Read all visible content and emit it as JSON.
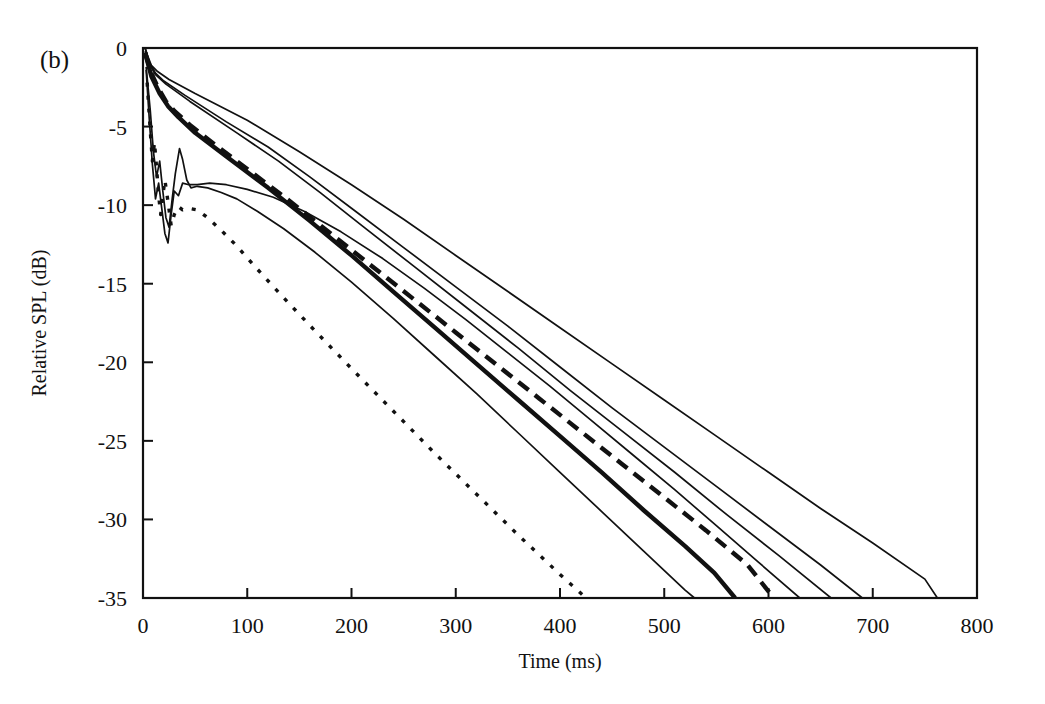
{
  "figure": {
    "panel_label": "(b)",
    "background_color": "#ffffff",
    "line_color": "#111111"
  },
  "chart_data": {
    "type": "line",
    "title": "",
    "subtitle": "",
    "xlabel": "Time (ms)",
    "ylabel": "Relative SPL (dB)",
    "xlim": [
      0,
      800
    ],
    "ylim": [
      -35,
      0
    ],
    "xticks": [
      0,
      100,
      200,
      300,
      400,
      500,
      600,
      700,
      800
    ],
    "xticklabels": [
      "0",
      "100",
      "200",
      "300",
      "400",
      "500",
      "600",
      "700",
      "800"
    ],
    "yticks": [
      0,
      -5,
      -10,
      -15,
      -20,
      -25,
      -30,
      -35
    ],
    "yticklabels": [
      "0",
      "-5",
      "-10",
      "-15",
      "-20",
      "-25",
      "-30",
      "-35"
    ],
    "grid": false,
    "legend": "none",
    "annotations": [
      "(b)"
    ],
    "series": [
      {
        "name": "decay-thin-1-longest",
        "style": "solid",
        "width": 1.7,
        "points": [
          [
            2,
            0.0
          ],
          [
            5,
            -0.6
          ],
          [
            8,
            -1.1
          ],
          [
            14,
            -1.5
          ],
          [
            25,
            -2.0
          ],
          [
            50,
            -2.9
          ],
          [
            100,
            -4.6
          ],
          [
            150,
            -6.6
          ],
          [
            200,
            -8.7
          ],
          [
            250,
            -10.9
          ],
          [
            300,
            -13.2
          ],
          [
            350,
            -15.5
          ],
          [
            400,
            -17.8
          ],
          [
            450,
            -20.1
          ],
          [
            500,
            -22.4
          ],
          [
            550,
            -24.7
          ],
          [
            600,
            -27.0
          ],
          [
            650,
            -29.3
          ],
          [
            700,
            -31.5
          ],
          [
            750,
            -33.8
          ],
          [
            762,
            -35.0
          ]
        ]
      },
      {
        "name": "decay-thin-2",
        "style": "solid",
        "width": 1.7,
        "points": [
          [
            2,
            0.0
          ],
          [
            6,
            -0.9
          ],
          [
            12,
            -1.6
          ],
          [
            20,
            -2.1
          ],
          [
            40,
            -3.0
          ],
          [
            80,
            -4.7
          ],
          [
            120,
            -6.3
          ],
          [
            160,
            -8.2
          ],
          [
            200,
            -10.2
          ],
          [
            250,
            -12.7
          ],
          [
            300,
            -15.2
          ],
          [
            350,
            -17.7
          ],
          [
            400,
            -20.3
          ],
          [
            450,
            -22.9
          ],
          [
            500,
            -25.4
          ],
          [
            550,
            -27.9
          ],
          [
            600,
            -30.4
          ],
          [
            650,
            -32.9
          ],
          [
            690,
            -35.0
          ]
        ]
      },
      {
        "name": "decay-thin-3",
        "style": "solid",
        "width": 1.7,
        "points": [
          [
            2,
            -0.2
          ],
          [
            6,
            -1.0
          ],
          [
            12,
            -1.7
          ],
          [
            22,
            -2.3
          ],
          [
            45,
            -3.4
          ],
          [
            90,
            -5.4
          ],
          [
            130,
            -7.2
          ],
          [
            170,
            -9.2
          ],
          [
            210,
            -11.3
          ],
          [
            260,
            -13.9
          ],
          [
            310,
            -16.5
          ],
          [
            360,
            -19.1
          ],
          [
            410,
            -21.8
          ],
          [
            460,
            -24.4
          ],
          [
            510,
            -27.0
          ],
          [
            560,
            -29.7
          ],
          [
            610,
            -32.3
          ],
          [
            660,
            -35.0
          ]
        ]
      },
      {
        "name": "decay-thick-dashed",
        "style": "dashed",
        "width": 4.4,
        "points": [
          [
            2,
            -0.3
          ],
          [
            8,
            -1.6
          ],
          [
            15,
            -2.6
          ],
          [
            22,
            -3.4
          ],
          [
            30,
            -4.0
          ],
          [
            45,
            -4.9
          ],
          [
            70,
            -6.2
          ],
          [
            100,
            -7.7
          ],
          [
            140,
            -9.7
          ],
          [
            180,
            -11.8
          ],
          [
            220,
            -13.9
          ],
          [
            260,
            -16.0
          ],
          [
            300,
            -18.1
          ],
          [
            340,
            -20.2
          ],
          [
            380,
            -22.3
          ],
          [
            420,
            -24.4
          ],
          [
            460,
            -26.5
          ],
          [
            500,
            -28.6
          ],
          [
            540,
            -30.7
          ],
          [
            580,
            -32.9
          ],
          [
            605,
            -35.0
          ]
        ]
      },
      {
        "name": "decay-thick-solid",
        "style": "solid",
        "width": 4.4,
        "points": [
          [
            2,
            -0.3
          ],
          [
            8,
            -1.8
          ],
          [
            16,
            -2.9
          ],
          [
            24,
            -3.7
          ],
          [
            34,
            -4.4
          ],
          [
            50,
            -5.4
          ],
          [
            80,
            -6.9
          ],
          [
            120,
            -8.9
          ],
          [
            160,
            -11.0
          ],
          [
            200,
            -13.2
          ],
          [
            240,
            -15.5
          ],
          [
            280,
            -17.8
          ],
          [
            320,
            -20.1
          ],
          [
            360,
            -22.4
          ],
          [
            400,
            -24.7
          ],
          [
            440,
            -27.0
          ],
          [
            480,
            -29.4
          ],
          [
            520,
            -31.7
          ],
          [
            548,
            -33.4
          ],
          [
            568,
            -35.0
          ]
        ]
      },
      {
        "name": "decay-thin-steep",
        "style": "solid",
        "width": 1.7,
        "points": [
          [
            3,
            -1.2
          ],
          [
            7,
            -4.0
          ],
          [
            10,
            -6.6
          ],
          [
            13,
            -8.2
          ],
          [
            16,
            -7.2
          ],
          [
            19,
            -9.1
          ],
          [
            22,
            -10.8
          ],
          [
            25,
            -11.4
          ],
          [
            28,
            -9.6
          ],
          [
            31,
            -8.0
          ],
          [
            35,
            -6.4
          ],
          [
            38,
            -7.1
          ],
          [
            42,
            -8.4
          ],
          [
            46,
            -8.9
          ],
          [
            52,
            -8.8
          ],
          [
            62,
            -8.9
          ],
          [
            75,
            -9.2
          ],
          [
            90,
            -9.6
          ],
          [
            110,
            -10.4
          ],
          [
            135,
            -11.5
          ],
          [
            165,
            -13.0
          ],
          [
            200,
            -14.9
          ],
          [
            240,
            -17.2
          ],
          [
            280,
            -19.6
          ],
          [
            320,
            -22.0
          ],
          [
            360,
            -24.5
          ],
          [
            400,
            -27.0
          ],
          [
            440,
            -29.5
          ],
          [
            480,
            -32.0
          ],
          [
            520,
            -34.5
          ],
          [
            529,
            -35.0
          ]
        ]
      },
      {
        "name": "decay-thin-plateau",
        "style": "solid",
        "width": 1.7,
        "points": [
          [
            3,
            -1.4
          ],
          [
            6,
            -4.5
          ],
          [
            9,
            -7.4
          ],
          [
            12,
            -9.6
          ],
          [
            15,
            -8.6
          ],
          [
            18,
            -10.2
          ],
          [
            21,
            -11.8
          ],
          [
            24,
            -12.4
          ],
          [
            27,
            -10.6
          ],
          [
            30,
            -9.1
          ],
          [
            34,
            -9.4
          ],
          [
            38,
            -8.6
          ],
          [
            44,
            -8.7
          ],
          [
            52,
            -8.7
          ],
          [
            64,
            -8.6
          ],
          [
            80,
            -8.7
          ],
          [
            100,
            -9.0
          ],
          [
            125,
            -9.5
          ],
          [
            155,
            -10.4
          ],
          [
            190,
            -11.7
          ],
          [
            230,
            -13.4
          ],
          [
            270,
            -15.3
          ],
          [
            310,
            -17.3
          ],
          [
            350,
            -19.4
          ],
          [
            390,
            -21.5
          ],
          [
            430,
            -23.7
          ],
          [
            470,
            -25.9
          ],
          [
            510,
            -28.1
          ],
          [
            550,
            -30.4
          ],
          [
            590,
            -32.7
          ],
          [
            630,
            -35.0
          ]
        ]
      },
      {
        "name": "decay-dotted",
        "style": "dotted",
        "width": 3.4,
        "points": [
          [
            4,
            -2.2
          ],
          [
            7,
            -5.3
          ],
          [
            9,
            -7.2
          ],
          [
            11,
            -6.0
          ],
          [
            13,
            -7.6
          ],
          [
            15,
            -9.4
          ],
          [
            17,
            -10.6
          ],
          [
            19,
            -9.4
          ],
          [
            21,
            -8.4
          ],
          [
            24,
            -9.8
          ],
          [
            27,
            -11.3
          ],
          [
            30,
            -10.6
          ],
          [
            34,
            -10.1
          ],
          [
            38,
            -10.3
          ],
          [
            44,
            -10.2
          ],
          [
            52,
            -10.3
          ],
          [
            62,
            -10.8
          ],
          [
            75,
            -11.6
          ],
          [
            90,
            -12.6
          ],
          [
            110,
            -14.1
          ],
          [
            135,
            -15.9
          ],
          [
            165,
            -18.0
          ],
          [
            200,
            -20.4
          ],
          [
            240,
            -23.1
          ],
          [
            280,
            -25.8
          ],
          [
            320,
            -28.4
          ],
          [
            360,
            -31.0
          ],
          [
            400,
            -33.5
          ],
          [
            420,
            -34.7
          ],
          [
            425,
            -35.0
          ]
        ]
      }
    ]
  }
}
